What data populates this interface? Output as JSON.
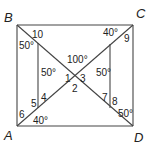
{
  "diagram": {
    "type": "geometry-square-with-diagonals",
    "vertices": {
      "B": {
        "label": "B",
        "x": 17,
        "y": 25
      },
      "C": {
        "label": "C",
        "x": 133,
        "y": 25
      },
      "A": {
        "label": "A",
        "x": 17,
        "y": 126
      },
      "D": {
        "label": "D",
        "x": 133,
        "y": 126
      }
    },
    "segments": [
      {
        "name": "side-BC",
        "x1": 17,
        "y1": 25,
        "x2": 133,
        "y2": 25
      },
      {
        "name": "side-CD",
        "x1": 133,
        "y1": 25,
        "x2": 133,
        "y2": 126
      },
      {
        "name": "side-DA",
        "x1": 133,
        "y1": 126,
        "x2": 17,
        "y2": 126
      },
      {
        "name": "side-AB",
        "x1": 17,
        "y1": 126,
        "x2": 17,
        "y2": 25
      },
      {
        "name": "diagonal-BD",
        "x1": 17,
        "y1": 25,
        "x2": 133,
        "y2": 126
      },
      {
        "name": "diagonal-AC",
        "x1": 17,
        "y1": 126,
        "x2": 133,
        "y2": 25
      },
      {
        "name": "left-vertical",
        "x1": 38,
        "y1": 43,
        "x2": 38,
        "y2": 108
      },
      {
        "name": "right-vertical",
        "x1": 110,
        "y1": 44,
        "x2": 110,
        "y2": 108
      }
    ],
    "angle_labels": [
      {
        "name": "angle-10",
        "text": "10",
        "x": 32,
        "y": 38
      },
      {
        "name": "angle-B-50",
        "text": "50°",
        "x": 19,
        "y": 49
      },
      {
        "name": "angle-left-50",
        "text": "50°",
        "x": 41,
        "y": 76
      },
      {
        "name": "angle-100",
        "text": "100°",
        "x": 67,
        "y": 63
      },
      {
        "name": "angle-C-40",
        "text": "40°",
        "x": 103,
        "y": 36
      },
      {
        "name": "angle-9",
        "text": "9",
        "x": 124,
        "y": 42
      },
      {
        "name": "angle-right-50",
        "text": "50°",
        "x": 96,
        "y": 76
      },
      {
        "name": "angle-1",
        "text": "1",
        "x": 65,
        "y": 82
      },
      {
        "name": "angle-2",
        "text": "2",
        "x": 72,
        "y": 92
      },
      {
        "name": "angle-3",
        "text": "3",
        "x": 80,
        "y": 82
      },
      {
        "name": "angle-4",
        "text": "4",
        "x": 41,
        "y": 101
      },
      {
        "name": "angle-5",
        "text": "5",
        "x": 31,
        "y": 107
      },
      {
        "name": "angle-6",
        "text": "6",
        "x": 19,
        "y": 118
      },
      {
        "name": "angle-A-40",
        "text": "40°",
        "x": 33,
        "y": 124
      },
      {
        "name": "angle-7",
        "text": "7",
        "x": 102,
        "y": 101
      },
      {
        "name": "angle-8",
        "text": "8",
        "x": 112,
        "y": 105
      },
      {
        "name": "angle-D-50",
        "text": "50°",
        "x": 118,
        "y": 117
      }
    ]
  }
}
